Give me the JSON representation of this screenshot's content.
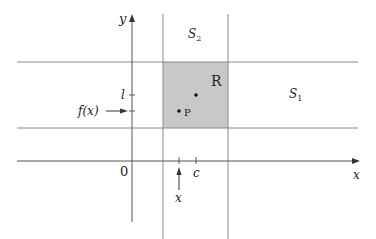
{
  "diagram": {
    "axes": {
      "x_label": "x",
      "y_label": "y",
      "origin_label": "0"
    },
    "regions": {
      "rectangle_label": "R",
      "horizontal_strip_label": "S",
      "horizontal_strip_subscript": "1",
      "vertical_strip_label": "S",
      "vertical_strip_subscript": "2"
    },
    "points": {
      "p_label": "P"
    },
    "tick_labels": {
      "l": "l",
      "c": "c"
    },
    "annotations": {
      "fx_label": "f(x)",
      "x_arrow_label": "x"
    },
    "colors": {
      "rect_fill": "#c8c8c8",
      "line": "#8a8a8a",
      "axis": "#555555",
      "text": "#222222"
    }
  }
}
